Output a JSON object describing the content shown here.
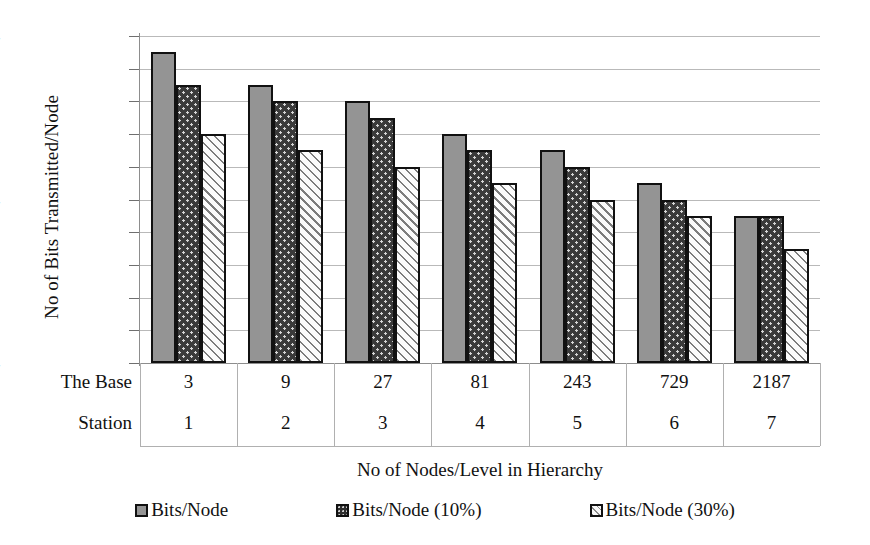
{
  "chart_data": {
    "type": "bar",
    "title": "",
    "xlabel": "No of Nodes/Level in Hierarchy",
    "ylabel": "No of Bits Transmitted/Node",
    "ylim": [
      54,
      74
    ],
    "ytick_step": 2,
    "yticks": [
      54,
      56,
      58,
      60,
      62,
      64,
      66,
      68,
      70,
      72,
      74
    ],
    "grid": true,
    "legend_position": "bottom",
    "categories": [
      "3",
      "9",
      "27",
      "81",
      "243",
      "729",
      "2187"
    ],
    "category_sublabels": [
      "1",
      "2",
      "3",
      "4",
      "5",
      "6",
      "7"
    ],
    "row_header_line1": "The Base",
    "row_header_line2": "Station",
    "series": [
      {
        "name": "Bits/Node",
        "values": [
          73,
          71,
          70,
          68,
          67,
          65,
          63
        ]
      },
      {
        "name": "Bits/Node (10%)",
        "values": [
          71,
          70,
          69,
          67,
          66,
          64,
          63
        ]
      },
      {
        "name": "Bits/Node (30%)",
        "values": [
          68,
          67,
          66,
          65,
          64,
          63,
          61
        ]
      }
    ]
  },
  "legend": {
    "items": [
      {
        "label": "Bits/Node"
      },
      {
        "label": "Bits/Node (10%)"
      },
      {
        "label": "Bits/Node (30%)"
      }
    ]
  },
  "colors": {
    "series_0_fill": "#949494",
    "series_1_fill": "#3a3a3a",
    "series_2_fill": "#fbfbfb",
    "bar_outline": "#111111",
    "gridline": "#b9b9b9",
    "axis": "#8d8d8d",
    "text": "#111111",
    "background": "#ffffff"
  }
}
